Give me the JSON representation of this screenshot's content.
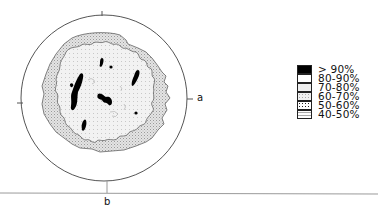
{
  "figure": {
    "type": "pole figure / orientation density contour diagram",
    "axes": {
      "right_label": "a",
      "bottom_label": "b"
    },
    "legend_title": "",
    "legend": [
      {
        "label": "> 90%",
        "pattern": "solid",
        "color": "#000000"
      },
      {
        "label": "80-90%",
        "pattern": "sparse-dots",
        "color": "#ffffff"
      },
      {
        "label": "70-80%",
        "pattern": "fine-dots",
        "color": "#e9e9e9"
      },
      {
        "label": "60-70%",
        "pattern": "light-stipple",
        "color": "#dedede"
      },
      {
        "label": "50-60%",
        "pattern": "dense-dots",
        "color": "#cccccc"
      },
      {
        "label": "40-50%",
        "pattern": "dashes",
        "color": "#efefef"
      }
    ],
    "colors": {
      "outline": "#555555",
      "outer_band_fill": "#d9d9d9",
      "inner_region_fill": "#efefef",
      "max_blobs": "#000000"
    }
  }
}
